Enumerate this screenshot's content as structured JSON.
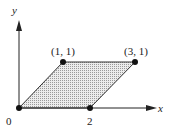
{
  "diagram": {
    "type": "parallelogram-on-axes",
    "axes": {
      "x_label": "x",
      "y_label": "y",
      "origin_label": "0"
    },
    "vertices": [
      {
        "name": "origin",
        "coords": [
          0,
          0
        ],
        "label": "0"
      },
      {
        "name": "p2",
        "coords": [
          2,
          0
        ],
        "label": "2"
      },
      {
        "name": "p3",
        "coords": [
          3,
          1
        ],
        "label": "(3, 1)"
      },
      {
        "name": "p1",
        "coords": [
          1,
          1
        ],
        "label": "(1, 1)"
      }
    ],
    "fill": "dotted gray",
    "colors": {
      "line": "#222222",
      "fill": "#d9d9d9"
    }
  }
}
